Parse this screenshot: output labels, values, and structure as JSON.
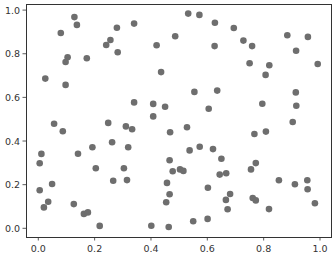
{
  "chart_data": {
    "type": "scatter",
    "title": "",
    "xlabel": "",
    "ylabel": "",
    "xlim": [
      -0.045,
      1.045
    ],
    "ylim": [
      -0.04,
      1.03
    ],
    "xticks": [
      0.0,
      0.2,
      0.4,
      0.6,
      0.8,
      1.0
    ],
    "xtick_labels": [
      "0.0",
      "0.2",
      "0.4",
      "0.6",
      "0.8",
      "1.0"
    ],
    "yticks": [
      0.0,
      0.2,
      0.4,
      0.6,
      0.8,
      1.0
    ],
    "ytick_labels": [
      "0.0",
      "0.2",
      "0.4",
      "0.6",
      "0.8",
      "1.0"
    ],
    "grid": false,
    "legend": null,
    "marker_color": "#6e6e6e",
    "series": [
      {
        "name": "points",
        "x": [
          0.128,
          0.137,
          0.08,
          0.279,
          0.34,
          0.256,
          0.241,
          0.282,
          0.104,
          0.097,
          0.172,
          0.025,
          0.532,
          0.572,
          0.627,
          0.694,
          0.486,
          0.42,
          0.626,
          0.436,
          0.728,
          0.759,
          0.884,
          0.957,
          0.915,
          0.75,
          0.82,
          0.807,
          0.992,
          0.097,
          0.34,
          0.056,
          0.087,
          0.248,
          0.311,
          0.333,
          0.192,
          0.262,
          0.319,
          0.011,
          0.141,
          0.408,
          0.45,
          0.408,
          0.554,
          0.635,
          0.605,
          0.468,
          0.528,
          0.537,
          0.573,
          0.62,
          0.914,
          0.795,
          0.916,
          0.903,
          0.808,
          0.767,
          0.005,
          0.204,
          0.304,
          0.266,
          0.315,
          0.049,
          0.005,
          0.035,
          0.02,
          0.126,
          0.162,
          0.176,
          0.218,
          0.466,
          0.477,
          0.503,
          0.515,
          0.65,
          0.644,
          0.667,
          0.457,
          0.602,
          0.466,
          0.454,
          0.681,
          0.666,
          0.672,
          0.401,
          0.463,
          0.55,
          0.601,
          0.772,
          0.755,
          0.854,
          0.911,
          0.955,
          0.956,
          0.761,
          0.772,
          0.819,
          0.982
        ],
        "y": [
          0.968,
          0.932,
          0.895,
          0.919,
          0.938,
          0.863,
          0.84,
          0.807,
          0.784,
          0.762,
          0.779,
          0.686,
          0.984,
          0.978,
          0.942,
          0.918,
          0.88,
          0.839,
          0.835,
          0.716,
          0.86,
          0.835,
          0.885,
          0.877,
          0.814,
          0.756,
          0.747,
          0.703,
          0.753,
          0.657,
          0.577,
          0.479,
          0.445,
          0.483,
          0.467,
          0.454,
          0.371,
          0.394,
          0.371,
          0.341,
          0.342,
          0.57,
          0.557,
          0.513,
          0.625,
          0.631,
          0.548,
          0.44,
          0.463,
          0.357,
          0.374,
          0.363,
          0.623,
          0.571,
          0.562,
          0.487,
          0.443,
          0.432,
          0.298,
          0.275,
          0.275,
          0.218,
          0.221,
          0.203,
          0.174,
          0.122,
          0.096,
          0.111,
          0.066,
          0.073,
          0.011,
          0.312,
          0.261,
          0.27,
          0.263,
          0.319,
          0.246,
          0.252,
          0.208,
          0.186,
          0.156,
          0.119,
          0.157,
          0.13,
          0.087,
          0.012,
          0.006,
          0.032,
          0.043,
          0.299,
          0.27,
          0.22,
          0.202,
          0.22,
          0.179,
          0.139,
          0.128,
          0.088,
          0.115
        ]
      }
    ]
  },
  "layout": {
    "axes_box": {
      "left": 26,
      "top": 4,
      "right": 331,
      "bottom": 237
    },
    "x_map": {
      "px_at_0": 38.3,
      "px_per_unit": 281.7
    },
    "y_map": {
      "px_at_0": 228.3,
      "px_per_unit": 218.2
    },
    "marker_radius": 3.3
  }
}
